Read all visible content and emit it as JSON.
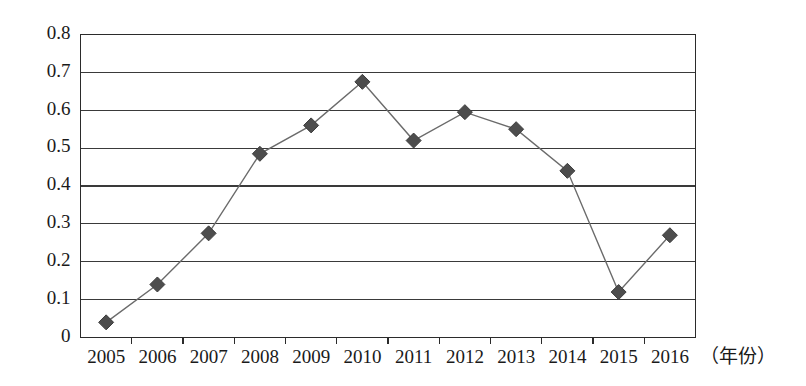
{
  "chart_data": {
    "type": "line",
    "title": "",
    "xlabel": "（年份）",
    "ylabel": "",
    "categories": [
      "2005",
      "2006",
      "2007",
      "2008",
      "2009",
      "2010",
      "2011",
      "2012",
      "2013",
      "2014",
      "2015",
      "2016"
    ],
    "values": [
      0.04,
      0.14,
      0.275,
      0.485,
      0.56,
      0.675,
      0.52,
      0.595,
      0.55,
      0.44,
      0.12,
      0.27
    ],
    "series": [
      {
        "name": "series-1",
        "values": [
          0.04,
          0.14,
          0.275,
          0.485,
          0.56,
          0.675,
          0.52,
          0.595,
          0.55,
          0.44,
          0.12,
          0.27
        ]
      }
    ],
    "ylim": [
      0,
      0.8
    ],
    "ytick_labels": [
      "0",
      "0.1",
      "0.2",
      "0.3",
      "0.4",
      "0.5",
      "0.6",
      "0.7",
      "0.8"
    ],
    "ytick_values": [
      0,
      0.1,
      0.2,
      0.3,
      0.4,
      0.5,
      0.6,
      0.7,
      0.8
    ],
    "grid": true,
    "grid_axis": "y",
    "legend": false,
    "legend_position": "none",
    "marker": "diamond",
    "colors": {
      "line": "#6b6b6b",
      "marker": "#4d4d4d",
      "grid": "#3a3a3a",
      "frame": "#2b2b2b",
      "text": "#1a1a1a",
      "background": "#ffffff"
    }
  },
  "axis": {
    "x_unit_label": "（年份）"
  }
}
